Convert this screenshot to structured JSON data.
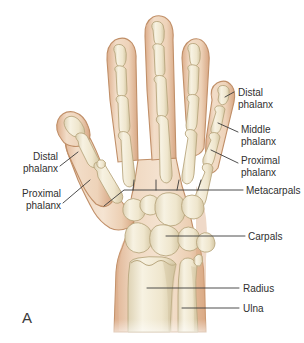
{
  "figure": {
    "panel_letter": "A",
    "colors": {
      "background": "#ffffff",
      "skin_fill": "#e8c4a4",
      "skin_fill_light": "#f2dcc6",
      "skin_outline": "#c08f68",
      "bone_fill": "#efe7d2",
      "bone_highlight": "#faf6e9",
      "bone_outline": "#b9a77f",
      "bone_shadow": "#d8cbaa",
      "label_text": "#2f2f2f",
      "leader_line": "#3a3a3a"
    }
  },
  "labels": {
    "right": [
      {
        "id": "distal-phalanx-right",
        "line1": "Distal",
        "line2": "phalanx"
      },
      {
        "id": "middle-phalanx-right",
        "line1": "Middle",
        "line2": "phalanx"
      },
      {
        "id": "proximal-phalanx-right",
        "line1": "Proximal",
        "line2": "phalanx"
      },
      {
        "id": "metacarpals",
        "line1": "Metacarpals",
        "line2": ""
      },
      {
        "id": "carpals",
        "line1": "Carpals",
        "line2": ""
      },
      {
        "id": "radius",
        "line1": "Radius",
        "line2": ""
      },
      {
        "id": "ulna",
        "line1": "Ulna",
        "line2": ""
      }
    ],
    "left": [
      {
        "id": "distal-phalanx-left",
        "line1": "Distal",
        "line2": "phalanx"
      },
      {
        "id": "proximal-phalanx-left",
        "line1": "Proximal",
        "line2": "phalanx"
      }
    ]
  },
  "anatomy": {
    "digits": [
      {
        "name": "thumb",
        "segments": [
          "distal phalanx",
          "proximal phalanx",
          "metacarpal"
        ]
      },
      {
        "name": "index-finger",
        "segments": [
          "distal phalanx",
          "middle phalanx",
          "proximal phalanx",
          "metacarpal"
        ]
      },
      {
        "name": "middle-finger",
        "segments": [
          "distal phalanx",
          "middle phalanx",
          "proximal phalanx",
          "metacarpal"
        ]
      },
      {
        "name": "ring-finger",
        "segments": [
          "distal phalanx",
          "middle phalanx",
          "proximal phalanx",
          "metacarpal"
        ]
      },
      {
        "name": "little-finger",
        "segments": [
          "distal phalanx",
          "middle phalanx",
          "proximal phalanx",
          "metacarpal"
        ]
      }
    ],
    "carpal_count": 8,
    "forearm_bones": [
      "radius",
      "ulna"
    ]
  }
}
